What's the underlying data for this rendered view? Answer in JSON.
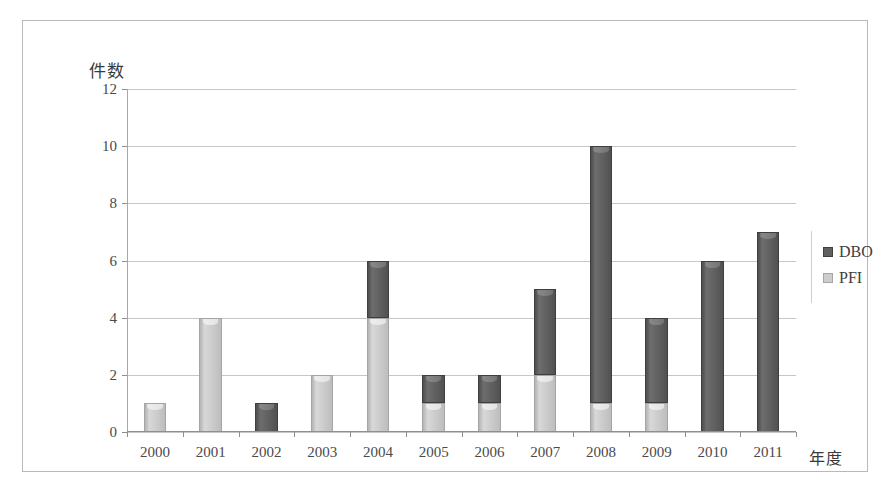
{
  "chart_data": {
    "type": "bar",
    "stacked": true,
    "title": "",
    "subtitle": "",
    "xlabel": "年度",
    "ylabel": "件数",
    "categories": [
      "2000",
      "2001",
      "2002",
      "2003",
      "2004",
      "2005",
      "2006",
      "2007",
      "2008",
      "2009",
      "2010",
      "2011"
    ],
    "series": [
      {
        "name": "PFI",
        "color": "#cdcdcd",
        "values": [
          1,
          4,
          0,
          2,
          4,
          1,
          1,
          2,
          1,
          1,
          0,
          0
        ]
      },
      {
        "name": "DBO",
        "color": "#606060",
        "values": [
          0,
          0,
          1,
          0,
          2,
          1,
          1,
          3,
          9,
          3,
          6,
          7
        ]
      }
    ],
    "totals": [
      1,
      4,
      1,
      2,
      6,
      2,
      2,
      5,
      10,
      4,
      6,
      7
    ],
    "ylim": [
      0,
      12
    ],
    "ytick_step": 2,
    "yticks": [
      "12",
      "10",
      "8",
      "6",
      "4",
      "2",
      "0"
    ],
    "ytick_values": [
      12,
      10,
      8,
      6,
      4,
      2,
      0
    ],
    "grid": true,
    "grid_axis": "y",
    "legend_position": "right",
    "legend_order": [
      "DBO",
      "PFI"
    ]
  },
  "legend": {
    "items": [
      {
        "label": "DBO",
        "swatch": "dbo"
      },
      {
        "label": "PFI",
        "swatch": "pfi"
      }
    ]
  },
  "axes": {
    "y_title": "件数",
    "x_title": "年度"
  }
}
